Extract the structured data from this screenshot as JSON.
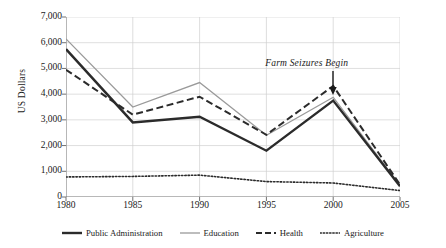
{
  "chart_data": {
    "type": "line",
    "title": "",
    "xlabel": "",
    "ylabel": "US Dollars",
    "x": [
      1980,
      1985,
      1990,
      1995,
      2000,
      2005
    ],
    "xtick_labels": [
      "1980",
      "1985",
      "1990",
      "1995",
      "2000",
      "2005"
    ],
    "ytick_labels": [
      "0",
      "1,000",
      "2,000",
      "3,000",
      "4,000",
      "5,000",
      "6,000",
      "7,000"
    ],
    "ytick_values": [
      0,
      1000,
      2000,
      3000,
      4000,
      5000,
      6000,
      7000
    ],
    "ylim": [
      0,
      7000
    ],
    "xlim": [
      1980,
      2005
    ],
    "grid": true,
    "legend_position": "bottom",
    "series": [
      {
        "name": "Public Administration",
        "style": "solid-thick-dark",
        "color": "#2b2b2b",
        "values": [
          5750,
          2900,
          3120,
          1800,
          3750,
          420
        ]
      },
      {
        "name": "Education",
        "style": "solid-thin-gray",
        "color": "#9a9a9a",
        "values": [
          6150,
          3500,
          4450,
          2400,
          3880,
          450
        ]
      },
      {
        "name": "Health",
        "style": "dashed-dark",
        "color": "#2b2b2b",
        "values": [
          4950,
          3200,
          3900,
          2420,
          4320,
          480
        ]
      },
      {
        "name": "Agriculture",
        "style": "dotted-dark",
        "color": "#2b2b2b",
        "values": [
          780,
          800,
          850,
          600,
          545,
          250
        ]
      }
    ],
    "annotations": [
      {
        "text": "Farm Seizures Begin",
        "x_value": 2000,
        "y_value": 5000,
        "arrow": "down"
      }
    ]
  }
}
